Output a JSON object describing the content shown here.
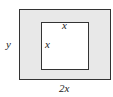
{
  "diagram": {
    "outer_rect": {
      "fill": "#e8e8e8",
      "stroke": "#333333"
    },
    "inner_square": {
      "fill": "#ffffff",
      "stroke": "#333333"
    },
    "labels": {
      "inner_top": "x",
      "inner_left": "x",
      "outer_height": "y",
      "outer_width": "2x"
    }
  }
}
